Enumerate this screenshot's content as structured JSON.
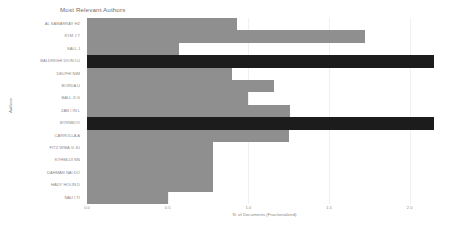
{
  "chart_data": {
    "type": "bar",
    "orientation": "horizontal",
    "title": "Most Relevant Authors",
    "xlabel": "N. of Documents (Fractionalized)",
    "ylabel": "Authors",
    "xlim": [
      0,
      2.2
    ],
    "grid": true,
    "legend": "none",
    "categories": [
      "AL SAMARRAY HZ",
      "KYM J T",
      "SALL J",
      "BALDRIGHI DION LU",
      "DELPHI NIM",
      "BORDA U",
      "BALL JI G",
      "ZAN I IN L",
      "BYRNBOV",
      "CARROLLA A",
      "FITZ WIBA G JU",
      "KYHMLUI NN",
      "DAHMAN NAI DO",
      "HADY HOLIN D",
      "NAU I TI"
    ],
    "values": [
      0.93,
      1.72,
      0.57,
      2.15,
      0.9,
      1.16,
      1.0,
      1.26,
      2.15,
      1.25,
      0.78,
      0.78,
      0.78,
      0.78,
      0.5
    ],
    "highlighted_indices": [
      3,
      8
    ],
    "tick_labels": [
      "0.0",
      "0.5",
      "1.0",
      "1.5",
      "2.0"
    ],
    "tick_values": [
      0,
      0.5,
      1,
      1.5,
      2
    ],
    "colors": {
      "bar": "#8f8f8f",
      "bar_highlight": "#1c1c1c",
      "gridline": "#f0f0f0",
      "text": "#8a8a8a",
      "title_text": "#6e6e6e",
      "background": "#ffffff"
    }
  }
}
